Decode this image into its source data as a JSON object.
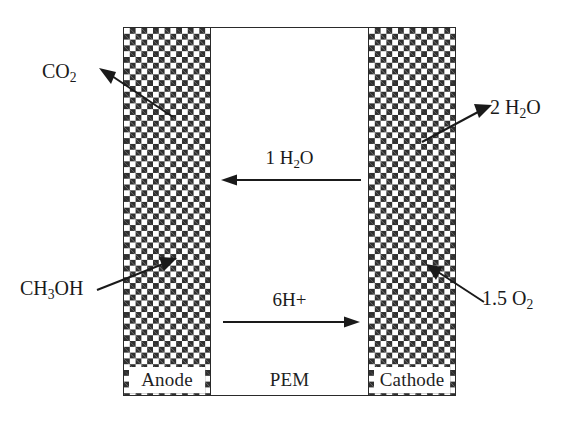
{
  "diagram": {
    "type": "schematic",
    "regions": {
      "anode_label": "Anode",
      "membrane_label": "PEM",
      "cathode_label": "Cathode"
    },
    "internal_flows": [
      {
        "id": "water-back-diffusion",
        "label": "1 H",
        "label_sub": "2",
        "label_tail": "O",
        "direction": "left",
        "from": "cathode-side",
        "to": "anode-side"
      },
      {
        "id": "proton-transport",
        "label": "6H+",
        "direction": "right",
        "from": "anode-side",
        "to": "cathode-side"
      }
    ],
    "species": [
      {
        "id": "co2-out",
        "text_main": "CO",
        "text_sub": "2",
        "text_tail": "",
        "side": "left",
        "flow": "out-of-anode"
      },
      {
        "id": "methanol-in",
        "text_main": "CH",
        "text_sub": "3",
        "text_tail": "OH",
        "side": "left",
        "flow": "into-anode"
      },
      {
        "id": "water-out",
        "text_main": "2 H",
        "text_sub": "2",
        "text_tail": "O",
        "side": "right",
        "flow": "out-of-cathode"
      },
      {
        "id": "oxygen-in",
        "text_main": "1.5 O",
        "text_sub": "2",
        "text_tail": "",
        "side": "right",
        "flow": "into-cathode"
      }
    ],
    "colors": {
      "ink": "#1a1a1a",
      "electrode_dark": "#2f2f2f",
      "electrode_light": "#ffffff",
      "background": "#ffffff"
    }
  }
}
